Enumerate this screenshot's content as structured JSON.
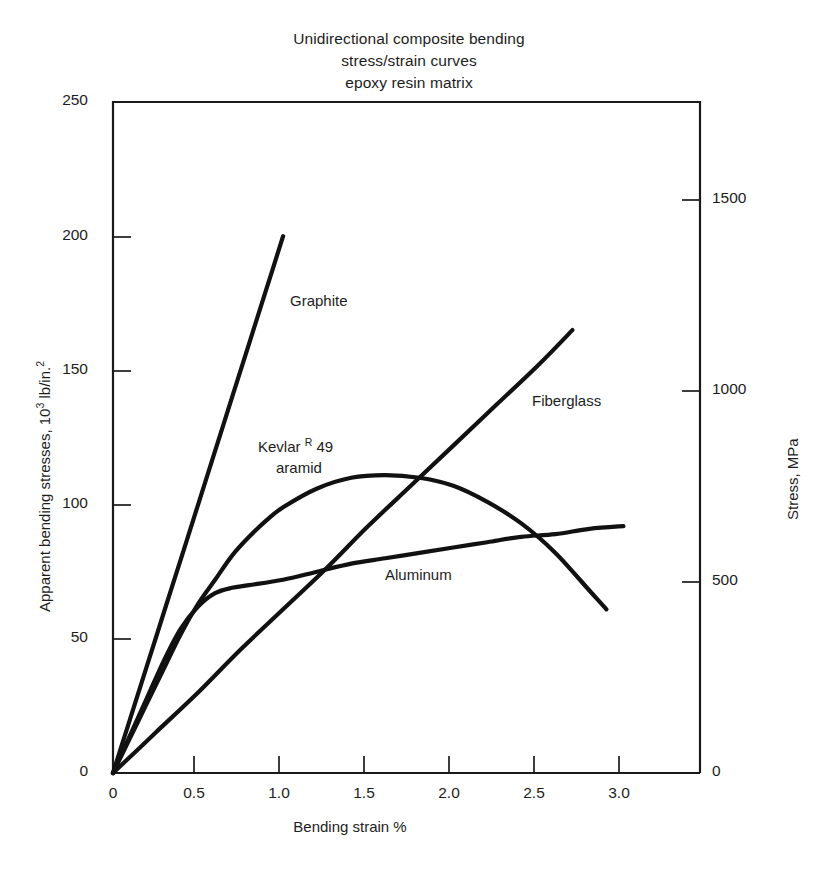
{
  "figure": {
    "title_lines": [
      "Unidirectional composite bending",
      "stress/strain curves",
      "epoxy resin matrix"
    ]
  },
  "axes": {
    "y_left": {
      "label_main": "Apparent bending stresses, 10",
      "label_sup": "3",
      "label_tail": " lb/in.",
      "label_tail_sup": "2",
      "full_label": "Apparent bending stresses, 10³ lb/in.²",
      "ticks": [
        "0",
        "50",
        "100",
        "150",
        "200",
        "250"
      ]
    },
    "y_right": {
      "label": "Stress, MPa",
      "ticks": [
        "0",
        "500",
        "1000",
        "1500"
      ]
    },
    "x": {
      "label": "Bending strain %",
      "ticks": [
        "0",
        "0.5",
        "1.0",
        "1.5",
        "2.0",
        "2.5",
        "3.0"
      ]
    }
  },
  "curve_labels": {
    "graphite": "Graphite",
    "kevlar_line1_a": "Kevlar ",
    "kevlar_line1_sup": "R",
    "kevlar_line1_b": " 49",
    "kevlar_line2": "aramid",
    "fiberglass": "Fiberglass",
    "aluminum": "Aluminum"
  },
  "colors": {
    "line": "#111111",
    "frame": "#1a1a1a",
    "background": "#ffffff"
  },
  "chart_data": {
    "type": "line",
    "title": "Unidirectional composite bending stress/strain curves epoxy resin matrix",
    "xlabel": "Bending strain %",
    "ylabel": "Apparent bending stresses, 10^3 lb/in.^2",
    "ylabel_secondary": "Stress, MPa",
    "xlim": [
      0,
      3.45
    ],
    "ylim": [
      0,
      250
    ],
    "ylim_secondary": [
      0,
      1725
    ],
    "xticks": [
      0,
      0.5,
      1.0,
      1.5,
      2.0,
      2.5,
      3.0
    ],
    "yticks": [
      0,
      50,
      100,
      150,
      200,
      250
    ],
    "yticks_secondary": [
      0,
      500,
      1000,
      1500
    ],
    "grid": false,
    "legend_position": "inline-annotations",
    "series": [
      {
        "name": "Graphite",
        "x": [
          0,
          0.1,
          0.2,
          0.3,
          0.4,
          0.5,
          0.6,
          0.7,
          0.8,
          0.9,
          1.0
        ],
        "y": [
          0,
          20,
          40,
          60,
          80,
          100,
          120,
          140,
          160,
          180,
          200
        ],
        "label_at": [
          1.02,
          178
        ]
      },
      {
        "name": "Kevlar R 49 aramid",
        "x": [
          0,
          0.1,
          0.2,
          0.3,
          0.4,
          0.5,
          0.6,
          0.7,
          0.8,
          0.9,
          1.0,
          1.2,
          1.4,
          1.6,
          1.8,
          2.0,
          2.2,
          2.4,
          2.6,
          2.8,
          2.9
        ],
        "y": [
          0,
          13,
          26,
          39,
          52,
          63,
          72,
          81,
          88,
          94,
          99,
          106,
          110,
          111,
          110,
          107,
          101,
          93,
          82,
          68,
          61
        ],
        "label_at": [
          1.05,
          122
        ]
      },
      {
        "name": "Fiberglass",
        "x": [
          0,
          0.25,
          0.5,
          0.75,
          1.0,
          1.25,
          1.5,
          1.75,
          2.0,
          2.25,
          2.5,
          2.7
        ],
        "y": [
          0,
          15,
          30,
          46,
          61,
          76,
          92,
          107,
          122,
          137,
          152,
          165
        ],
        "label_at": [
          2.3,
          141
        ]
      },
      {
        "name": "Aluminum",
        "x": [
          0,
          0.1,
          0.2,
          0.3,
          0.4,
          0.5,
          0.6,
          0.7,
          0.8,
          1.0,
          1.2,
          1.4,
          1.6,
          1.8,
          2.0,
          2.2,
          2.4,
          2.6,
          2.8,
          3.0
        ],
        "y": [
          0,
          14,
          28,
          42,
          54,
          62,
          67,
          69,
          70,
          72,
          75,
          78,
          80,
          82,
          84,
          86,
          88,
          89,
          91,
          92
        ],
        "label_at": [
          1.6,
          82
        ]
      }
    ]
  }
}
